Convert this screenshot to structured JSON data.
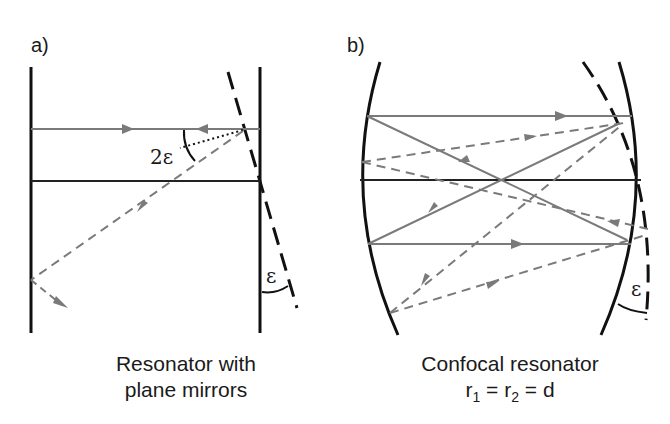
{
  "panels": {
    "a": {
      "label": "a)",
      "caption_line1": "Resonator with",
      "caption_line2": "plane mirrors",
      "angle_label_2e": "2ε",
      "angle_label_e": "ε"
    },
    "b": {
      "label": "b)",
      "caption_line1": "Confocal resonator",
      "caption_r": "r",
      "caption_sub1": "1",
      "caption_eq1": " = r",
      "caption_sub2": "2",
      "caption_eq2": " = d",
      "angle_label_e": "ε"
    }
  },
  "colors": {
    "mirror": "#111111",
    "ray": "#7a7a7a",
    "axis": "#222222"
  }
}
